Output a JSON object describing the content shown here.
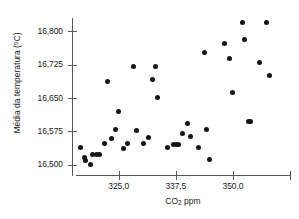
{
  "chart_data": {
    "type": "scatter",
    "title": "",
    "xlabel": "CO2 ppm",
    "ylabel": "Média da temperatura (°C)",
    "xlim": [
      315.0,
      362.5
    ],
    "ylim": [
      16475,
      16830
    ],
    "grid": false,
    "legend": null,
    "marker_color": "#141414",
    "axis_color": "#55585a",
    "x_ticks": [
      325.0,
      337.5,
      350.0,
      362.5
    ],
    "x_tick_labels": [
      "325,0",
      "337,5",
      "350,0",
      ""
    ],
    "y_ticks": [
      16500,
      16575,
      16650,
      16725,
      16800
    ],
    "y_tick_labels": [
      "16,500",
      "16,575",
      "16,650",
      "16,725",
      "16,800"
    ],
    "points": [
      {
        "x": 316.6,
        "y": 16538
      },
      {
        "x": 317.6,
        "y": 16517
      },
      {
        "x": 317.8,
        "y": 16509
      },
      {
        "x": 318.8,
        "y": 16501
      },
      {
        "x": 319.3,
        "y": 16523
      },
      {
        "x": 320.1,
        "y": 16524
      },
      {
        "x": 320.9,
        "y": 16523
      },
      {
        "x": 322.0,
        "y": 16547
      },
      {
        "x": 322.6,
        "y": 16687
      },
      {
        "x": 323.5,
        "y": 16559
      },
      {
        "x": 324.2,
        "y": 16580
      },
      {
        "x": 325.0,
        "y": 16620
      },
      {
        "x": 326.0,
        "y": 16537
      },
      {
        "x": 327.0,
        "y": 16548
      },
      {
        "x": 328.3,
        "y": 16722
      },
      {
        "x": 328.8,
        "y": 16578
      },
      {
        "x": 330.5,
        "y": 16547
      },
      {
        "x": 331.5,
        "y": 16562
      },
      {
        "x": 332.5,
        "y": 16692
      },
      {
        "x": 333.0,
        "y": 16722
      },
      {
        "x": 333.6,
        "y": 16652
      },
      {
        "x": 335.6,
        "y": 16538
      },
      {
        "x": 337.0,
        "y": 16546
      },
      {
        "x": 337.6,
        "y": 16546
      },
      {
        "x": 338.2,
        "y": 16546
      },
      {
        "x": 339.0,
        "y": 16570
      },
      {
        "x": 340.0,
        "y": 16592
      },
      {
        "x": 340.7,
        "y": 16563
      },
      {
        "x": 342.5,
        "y": 16538
      },
      {
        "x": 343.8,
        "y": 16753
      },
      {
        "x": 344.3,
        "y": 16580
      },
      {
        "x": 344.8,
        "y": 16513
      },
      {
        "x": 348.1,
        "y": 16773
      },
      {
        "x": 349.2,
        "y": 16738
      },
      {
        "x": 350.0,
        "y": 16662
      },
      {
        "x": 352.1,
        "y": 16820
      },
      {
        "x": 352.6,
        "y": 16782
      },
      {
        "x": 353.4,
        "y": 16597
      },
      {
        "x": 353.9,
        "y": 16597
      },
      {
        "x": 355.8,
        "y": 16730
      },
      {
        "x": 357.4,
        "y": 16820
      },
      {
        "x": 358.0,
        "y": 16700
      }
    ]
  },
  "figure": {
    "x_axis_title": "CO",
    "x_axis_title_sub": "2",
    "x_axis_title_rest": " ppm",
    "y_axis_title": "Média da temperatura (",
    "y_axis_title_sup": "o",
    "y_axis_title_rest": "C)"
  }
}
